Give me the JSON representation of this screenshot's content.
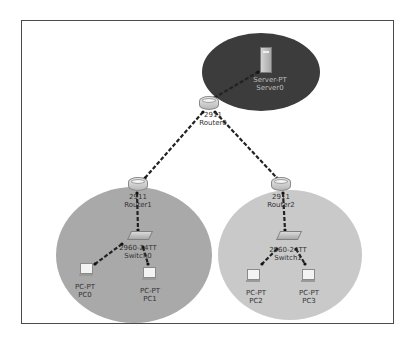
{
  "diagram": {
    "type": "network-topology",
    "colors": {
      "frame_border": "#4a4a4a",
      "server_zone": "#3c3c3c",
      "lan1_zone": "#a9a9a9",
      "lan2_zone": "#c9c9c9",
      "link": "#222222"
    },
    "zones": [
      {
        "id": "server-zone",
        "cx": 261,
        "cy": 72,
        "rx": 59,
        "ry": 39
      },
      {
        "id": "lan1-zone",
        "cx": 134,
        "cy": 255,
        "rx": 78,
        "ry": 68
      },
      {
        "id": "lan2-zone",
        "cx": 290,
        "cy": 255,
        "rx": 72,
        "ry": 65
      }
    ],
    "devices": [
      {
        "id": "server0",
        "kind": "server",
        "x": 266,
        "y": 60,
        "model": "Server-PT",
        "name": "Server0"
      },
      {
        "id": "router0",
        "kind": "router",
        "x": 209,
        "y": 104,
        "model": "2911",
        "name": "Router0"
      },
      {
        "id": "router1",
        "kind": "router",
        "x": 138,
        "y": 185,
        "model": "2911",
        "name": "Router1"
      },
      {
        "id": "router2",
        "kind": "router",
        "x": 281,
        "y": 185,
        "model": "2911",
        "name": "Router2"
      },
      {
        "id": "switch0",
        "kind": "switch",
        "x": 140,
        "y": 236,
        "model": "2960-24TT",
        "name": "Switch0"
      },
      {
        "id": "switch1",
        "kind": "switch",
        "x": 289,
        "y": 236,
        "model": "2960-24TT",
        "name": "Switch1"
      },
      {
        "id": "pc0",
        "kind": "pc",
        "x": 87,
        "y": 269,
        "model": "PC-PT",
        "name": "PC0"
      },
      {
        "id": "pc1",
        "kind": "pc",
        "x": 150,
        "y": 272,
        "model": "PC-PT",
        "name": "PC1"
      },
      {
        "id": "pc2",
        "kind": "pc",
        "x": 254,
        "y": 275,
        "model": "PC-PT",
        "name": "PC2"
      },
      {
        "id": "pc3",
        "kind": "pc",
        "x": 309,
        "y": 275,
        "model": "PC-PT",
        "name": "PC3"
      }
    ],
    "links": [
      {
        "from": "router0",
        "to": "server0",
        "x1": 214,
        "y1": 98,
        "x2": 258,
        "y2": 72
      },
      {
        "from": "router0",
        "to": "router1",
        "x1": 203,
        "y1": 112,
        "x2": 145,
        "y2": 178
      },
      {
        "from": "router0",
        "to": "router2",
        "x1": 215,
        "y1": 112,
        "x2": 277,
        "y2": 178
      },
      {
        "from": "router1",
        "to": "switch0",
        "x1": 137,
        "y1": 193,
        "x2": 138,
        "y2": 230
      },
      {
        "from": "router2",
        "to": "switch1",
        "x1": 283,
        "y1": 193,
        "x2": 285,
        "y2": 230
      },
      {
        "from": "switch0",
        "to": "pc0",
        "x1": 122,
        "y1": 244,
        "x2": 95,
        "y2": 264
      },
      {
        "from": "switch0",
        "to": "pc1",
        "x1": 143,
        "y1": 247,
        "x2": 148,
        "y2": 264
      },
      {
        "from": "switch1",
        "to": "pc2",
        "x1": 277,
        "y1": 249,
        "x2": 262,
        "y2": 264
      },
      {
        "from": "switch1",
        "to": "pc3",
        "x1": 296,
        "y1": 249,
        "x2": 305,
        "y2": 264
      }
    ],
    "labels": {
      "server0": {
        "line1": "Server-PT",
        "line2": "Server0"
      },
      "router0": {
        "line1": "2911",
        "line2": "Router0"
      },
      "router1": {
        "line1": "2911",
        "line2": "Router1"
      },
      "router2": {
        "line1": "2911",
        "line2": "Router2"
      },
      "switch0": {
        "line1": "2960-24TT",
        "line2": "Switch0"
      },
      "switch1": {
        "line1": "2960-24TT",
        "line2": "Switch1"
      },
      "pc0": {
        "line1": "PC-PT",
        "line2": "PC0"
      },
      "pc1": {
        "line1": "PC-PT",
        "line2": "PC1"
      },
      "pc2": {
        "line1": "PC-PT",
        "line2": "PC2"
      },
      "pc3": {
        "line1": "PC-PT",
        "line2": "PC3"
      }
    }
  }
}
